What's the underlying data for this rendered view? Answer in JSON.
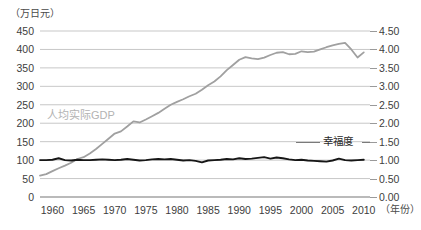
{
  "chart_data": {
    "type": "line",
    "title": "",
    "subtitle": "",
    "unit_label_left": "（万日元）",
    "xlabel": "（年份）",
    "ylabel": "",
    "grid": true,
    "legend_position": "inline-annotation",
    "x": [
      1958,
      1959,
      1960,
      1961,
      1962,
      1963,
      1964,
      1965,
      1966,
      1967,
      1968,
      1969,
      1970,
      1971,
      1972,
      1973,
      1974,
      1975,
      1976,
      1977,
      1978,
      1979,
      1980,
      1981,
      1982,
      1983,
      1984,
      1985,
      1986,
      1987,
      1988,
      1989,
      1990,
      1991,
      1992,
      1993,
      1994,
      1995,
      1996,
      1997,
      1998,
      1999,
      2000,
      2001,
      2002,
      2003,
      2004,
      2005,
      2006,
      2007,
      2008,
      2009,
      2010
    ],
    "xticks": [
      1960,
      1965,
      1970,
      1975,
      1980,
      1985,
      1990,
      1995,
      2000,
      2005,
      2010
    ],
    "xlim": [
      1958,
      2011
    ],
    "left_axis": {
      "name": "人均实际GDP",
      "unit": "万日元",
      "ticks": [
        0,
        50,
        100,
        150,
        200,
        250,
        300,
        350,
        400,
        450
      ],
      "ylim": [
        0,
        450
      ]
    },
    "right_axis": {
      "name": "幸福度",
      "ticks": [
        "0.00",
        "0.50",
        "1.00",
        "1.50",
        "2.00",
        "2.50",
        "3.00",
        "3.50",
        "4.00",
        "4.50"
      ],
      "ylim": [
        0,
        4.5
      ]
    },
    "series": [
      {
        "name": "人均实际GDP",
        "axis": "left",
        "color": "#a0a0a0",
        "values": [
          58,
          62,
          70,
          78,
          85,
          93,
          103,
          108,
          118,
          130,
          144,
          158,
          172,
          178,
          191,
          205,
          202,
          210,
          219,
          228,
          239,
          250,
          258,
          265,
          273,
          280,
          291,
          303,
          313,
          327,
          344,
          358,
          372,
          379,
          376,
          374,
          378,
          385,
          391,
          393,
          387,
          388,
          395,
          393,
          394,
          400,
          406,
          411,
          415,
          418,
          400,
          378,
          392
        ]
      },
      {
        "name": "幸福度",
        "axis": "right",
        "color": "#1a1a1a",
        "values": [
          1.0,
          1.0,
          1.01,
          1.05,
          1.0,
          0.99,
          1.01,
          1.0,
          1.0,
          1.01,
          1.02,
          1.01,
          1.0,
          1.01,
          1.03,
          1.01,
          0.99,
          1.0,
          1.02,
          1.03,
          1.02,
          1.03,
          1.01,
          0.99,
          1.0,
          0.98,
          0.94,
          0.99,
          1.0,
          1.01,
          1.03,
          1.02,
          1.05,
          1.03,
          1.04,
          1.06,
          1.08,
          1.04,
          1.07,
          1.05,
          1.02,
          1.0,
          1.01,
          0.99,
          0.98,
          0.97,
          0.96,
          0.99,
          1.04,
          1.0,
          0.99,
          1.0,
          1.01
        ]
      }
    ],
    "annotations": [
      {
        "text": "人均实际GDP",
        "color": "#b3b3b3"
      },
      {
        "text": "幸福度",
        "color": "#2b2b2b"
      }
    ]
  }
}
